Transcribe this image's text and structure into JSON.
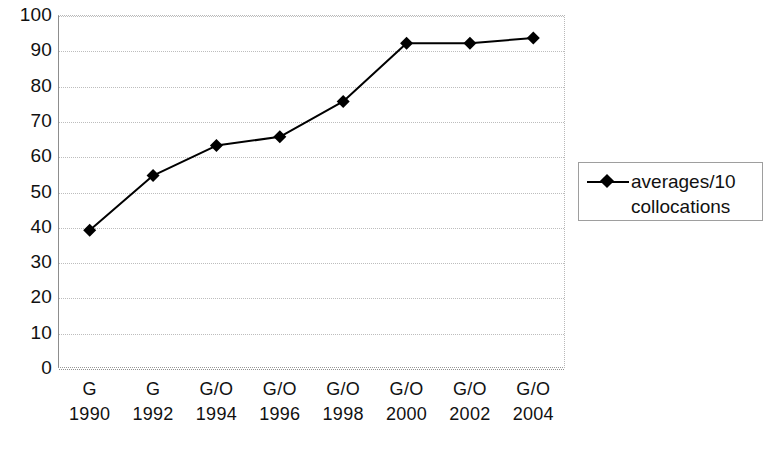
{
  "chart_data": {
    "type": "line",
    "title": "",
    "subtitle": "",
    "xlabel": "",
    "ylabel": "",
    "ylim": [
      0,
      100
    ],
    "ytick_step": 10,
    "yticks": [
      "100",
      "90",
      "80",
      "70",
      "60",
      "50",
      "40",
      "30",
      "20",
      "10",
      "0"
    ],
    "grid": true,
    "grid_style": "dotted-horizontal",
    "legend_position": "right",
    "categories": [
      "G\n1990",
      "G\n1992",
      "G/O\n1994",
      "G/O\n1996",
      "G/O\n1998",
      "G/O\n2000",
      "G/O\n2002",
      "G/O\n2004"
    ],
    "category_labels": [
      {
        "top": "G",
        "bottom": "1990"
      },
      {
        "top": "G",
        "bottom": "1992"
      },
      {
        "top": "G/O",
        "bottom": "1994"
      },
      {
        "top": "G/O",
        "bottom": "1996"
      },
      {
        "top": "G/O",
        "bottom": "1998"
      },
      {
        "top": "G/O",
        "bottom": "2000"
      },
      {
        "top": "G/O",
        "bottom": "2002"
      },
      {
        "top": "G/O",
        "bottom": "2004"
      }
    ],
    "series": [
      {
        "name": "averages/10 collocations",
        "values": [
          39,
          54.5,
          63,
          65.5,
          75.5,
          92,
          92,
          93.5
        ],
        "color": "#000000",
        "marker": "diamond",
        "line_width": 2
      }
    ]
  },
  "legend": {
    "entries": [
      {
        "label_line1": "averages/10",
        "label_line2": "collocations",
        "marker": "diamond-marker",
        "color": "#000000"
      }
    ]
  },
  "colors": {
    "line": "#000000",
    "marker": "#000000",
    "grid": "#bdbdbd",
    "axis": "#8d8d8d",
    "background": "#ffffff",
    "text": "#111111"
  }
}
